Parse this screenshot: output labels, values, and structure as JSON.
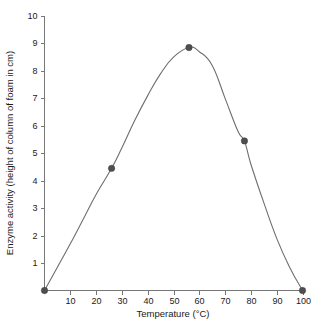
{
  "chart_data": {
    "type": "line",
    "title": "",
    "xlabel": "Temperature (°C)",
    "ylabel": "Enzyme activity (height of column of foam in cm)",
    "xlim": [
      0,
      100
    ],
    "ylim": [
      0,
      10
    ],
    "grid": false,
    "legend": false,
    "xticks": [
      10,
      20,
      30,
      40,
      50,
      60,
      70,
      80,
      90,
      100
    ],
    "xtick_labels": [
      "10",
      "20",
      "30",
      "40",
      "50",
      "60",
      "70",
      "80",
      "90",
      "100"
    ],
    "yticks": [
      1,
      2,
      3,
      4,
      5,
      6,
      7,
      8,
      9,
      10
    ],
    "ytick_labels": [
      "1",
      "2",
      "3",
      "4",
      "5",
      "6",
      "7",
      "8",
      "9",
      "10"
    ],
    "series": [
      {
        "name": "Enzyme activity",
        "marker_points": [
          {
            "x": 0,
            "y": 0
          },
          {
            "x": 26,
            "y": 4.45
          },
          {
            "x": 56,
            "y": 8.85
          },
          {
            "x": 77.5,
            "y": 5.45
          },
          {
            "x": 100,
            "y": 0
          }
        ],
        "curve_points": [
          {
            "x": 0,
            "y": 0
          },
          {
            "x": 5,
            "y": 0.85
          },
          {
            "x": 10,
            "y": 1.7
          },
          {
            "x": 15,
            "y": 2.6
          },
          {
            "x": 20,
            "y": 3.5
          },
          {
            "x": 26,
            "y": 4.45
          },
          {
            "x": 30,
            "y": 5.2
          },
          {
            "x": 35,
            "y": 6.2
          },
          {
            "x": 40,
            "y": 7.1
          },
          {
            "x": 45,
            "y": 7.9
          },
          {
            "x": 50,
            "y": 8.5
          },
          {
            "x": 56,
            "y": 8.85
          },
          {
            "x": 60,
            "y": 8.7
          },
          {
            "x": 65,
            "y": 8.2
          },
          {
            "x": 70,
            "y": 7.0
          },
          {
            "x": 75,
            "y": 5.8
          },
          {
            "x": 77.5,
            "y": 5.45
          },
          {
            "x": 80,
            "y": 4.6
          },
          {
            "x": 85,
            "y": 3.2
          },
          {
            "x": 90,
            "y": 1.9
          },
          {
            "x": 95,
            "y": 0.85
          },
          {
            "x": 100,
            "y": 0
          }
        ]
      }
    ],
    "colors": {
      "line": "#6e6e6e",
      "marker": "#4f4f4f",
      "axis": "#777777",
      "text": "#1a1a1a",
      "background": "#ffffff"
    }
  }
}
